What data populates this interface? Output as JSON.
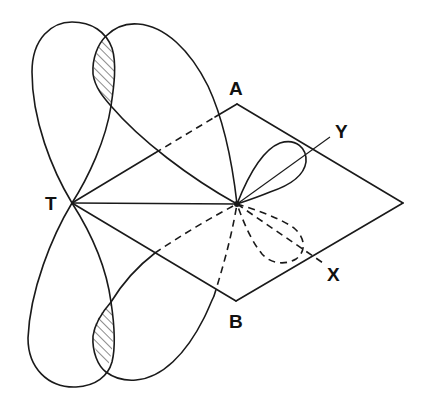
{
  "diagram": {
    "labels": {
      "T": "T",
      "A": "A",
      "B": "B",
      "Y": "Y",
      "X": "X"
    },
    "points": {
      "T": [
        72,
        203
      ],
      "A": [
        237,
        104
      ],
      "right_vertex": [
        403,
        203
      ],
      "B": [
        236,
        301
      ],
      "center": [
        237,
        204
      ]
    },
    "colors": {
      "line": "#1a1a1a",
      "background": "#ffffff"
    }
  }
}
